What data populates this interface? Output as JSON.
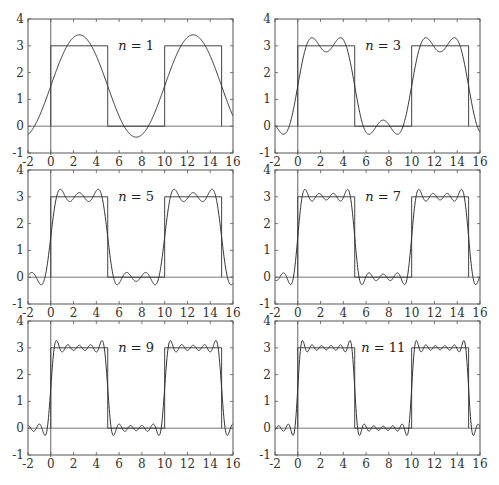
{
  "chart_data": [
    {
      "type": "line",
      "title": "",
      "annotation": "n = 1",
      "n": 1,
      "xlabel": "",
      "ylabel": "",
      "xlim": [
        -2,
        16
      ],
      "ylim": [
        -1,
        4
      ],
      "xticks": [
        "-2",
        "0",
        "2",
        "4",
        "6",
        "8",
        "10",
        "12",
        "14",
        "16"
      ],
      "yticks": [
        "-1",
        "0",
        "1",
        "2",
        "3",
        "4"
      ],
      "series": [
        {
          "name": "square wave",
          "description": "3 on [0,5] and [10,15], 0 elsewhere (period 10)",
          "x": [
            0,
            0,
            5,
            5,
            10,
            10,
            15,
            15
          ],
          "y": [
            0,
            3,
            3,
            0,
            0,
            3,
            3,
            0
          ]
        },
        {
          "name": "Fourier partial sum",
          "formula": "1.5 + sum over odd k<=n of (6/(k*pi))*sin(k*pi*x/5)"
        }
      ]
    },
    {
      "type": "line",
      "annotation": "n = 3",
      "n": 3,
      "xlim": [
        -2,
        16
      ],
      "ylim": [
        -1,
        4
      ],
      "xticks": [
        "-2",
        "0",
        "2",
        "4",
        "6",
        "8",
        "10",
        "12",
        "14",
        "16"
      ],
      "yticks": [
        "-1",
        "0",
        "1",
        "2",
        "3",
        "4"
      ],
      "series": [
        {
          "name": "square wave",
          "x": [
            0,
            0,
            5,
            5,
            10,
            10,
            15,
            15
          ],
          "y": [
            0,
            3,
            3,
            0,
            0,
            3,
            3,
            0
          ]
        },
        {
          "name": "Fourier partial sum",
          "formula": "1.5 + sum over odd k<=n of (6/(k*pi))*sin(k*pi*x/5)"
        }
      ]
    },
    {
      "type": "line",
      "annotation": "n = 5",
      "n": 5,
      "xlim": [
        -2,
        16
      ],
      "ylim": [
        -1,
        4
      ],
      "xticks": [
        "-2",
        "0",
        "2",
        "4",
        "6",
        "8",
        "10",
        "12",
        "14",
        "16"
      ],
      "yticks": [
        "-1",
        "0",
        "1",
        "2",
        "3",
        "4"
      ],
      "series": [
        {
          "name": "square wave",
          "x": [
            0,
            0,
            5,
            5,
            10,
            10,
            15,
            15
          ],
          "y": [
            0,
            3,
            3,
            0,
            0,
            3,
            3,
            0
          ]
        },
        {
          "name": "Fourier partial sum",
          "formula": "1.5 + sum over odd k<=n of (6/(k*pi))*sin(k*pi*x/5)"
        }
      ]
    },
    {
      "type": "line",
      "annotation": "n = 7",
      "n": 7,
      "xlim": [
        -2,
        16
      ],
      "ylim": [
        -1,
        4
      ],
      "xticks": [
        "-2",
        "0",
        "2",
        "4",
        "6",
        "8",
        "10",
        "12",
        "14",
        "16"
      ],
      "yticks": [
        "-1",
        "0",
        "1",
        "2",
        "3",
        "4"
      ],
      "series": [
        {
          "name": "square wave",
          "x": [
            0,
            0,
            5,
            5,
            10,
            10,
            15,
            15
          ],
          "y": [
            0,
            3,
            3,
            0,
            0,
            3,
            3,
            0
          ]
        },
        {
          "name": "Fourier partial sum",
          "formula": "1.5 + sum over odd k<=n of (6/(k*pi))*sin(k*pi*x/5)"
        }
      ]
    },
    {
      "type": "line",
      "annotation": "n = 9",
      "n": 9,
      "xlim": [
        -2,
        16
      ],
      "ylim": [
        -1,
        4
      ],
      "xticks": [
        "-2",
        "0",
        "2",
        "4",
        "6",
        "8",
        "10",
        "12",
        "14",
        "16"
      ],
      "yticks": [
        "-1",
        "0",
        "1",
        "2",
        "3",
        "4"
      ],
      "series": [
        {
          "name": "square wave",
          "x": [
            0,
            0,
            5,
            5,
            10,
            10,
            15,
            15
          ],
          "y": [
            0,
            3,
            3,
            0,
            0,
            3,
            3,
            0
          ]
        },
        {
          "name": "Fourier partial sum",
          "formula": "1.5 + sum over odd k<=n of (6/(k*pi))*sin(k*pi*x/5)"
        }
      ]
    },
    {
      "type": "line",
      "annotation": "n = 11",
      "n": 11,
      "xlim": [
        -2,
        16
      ],
      "ylim": [
        -1,
        4
      ],
      "xticks": [
        "-2",
        "0",
        "2",
        "4",
        "6",
        "8",
        "10",
        "12",
        "14",
        "16"
      ],
      "yticks": [
        "-1",
        "0",
        "1",
        "2",
        "3",
        "4"
      ],
      "series": [
        {
          "name": "square wave",
          "x": [
            0,
            0,
            5,
            5,
            10,
            10,
            15,
            15
          ],
          "y": [
            0,
            3,
            3,
            0,
            0,
            3,
            3,
            0
          ]
        },
        {
          "name": "Fourier partial sum",
          "formula": "1.5 + sum over odd k<=n of (6/(k*pi))*sin(k*pi*x/5)"
        }
      ]
    }
  ],
  "model": {
    "mean": 1.5,
    "amplitude": 3,
    "period": 10,
    "half_period": 5
  }
}
